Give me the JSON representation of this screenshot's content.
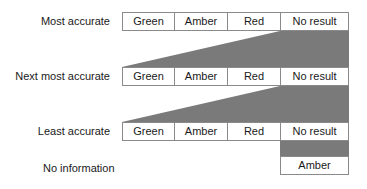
{
  "colors": {
    "shade": "#7a7a7a",
    "border": "#8a8a8a",
    "text": "#1a1a1a",
    "background": "#ffffff"
  },
  "rows": [
    {
      "label": "Most accurate",
      "cells": [
        "Green",
        "Amber",
        "Red",
        "No result"
      ]
    },
    {
      "label": "Next most accurate",
      "cells": [
        "Green",
        "Amber",
        "Red",
        "No result"
      ]
    },
    {
      "label": "Least accurate",
      "cells": [
        "Green",
        "Amber",
        "Red",
        "No result"
      ]
    },
    {
      "label": "No information",
      "cells": [
        "Amber"
      ]
    }
  ]
}
